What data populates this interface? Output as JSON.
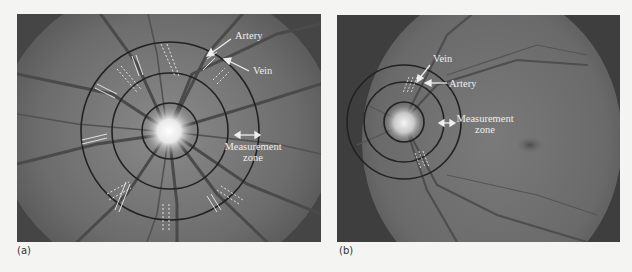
{
  "figure": {
    "panels": [
      {
        "id": "a",
        "caption": "(a)",
        "labels": {
          "artery": "Artery",
          "vein": "Vein",
          "measurement_line1": "Measurement",
          "measurement_line2": "zone"
        }
      },
      {
        "id": "b",
        "caption": "(b)",
        "labels": {
          "vein": "Vein",
          "artery": "Artery",
          "measurement_line1": "Measurement",
          "measurement_line2": "zone"
        }
      }
    ],
    "colors": {
      "background": "#f4f4f2",
      "fundus": "#6e6e6e",
      "frame": "#3e3e3e",
      "ring": "#222222",
      "annotation": "#eeeeee",
      "optic_disc": "#f2f2f2"
    }
  }
}
